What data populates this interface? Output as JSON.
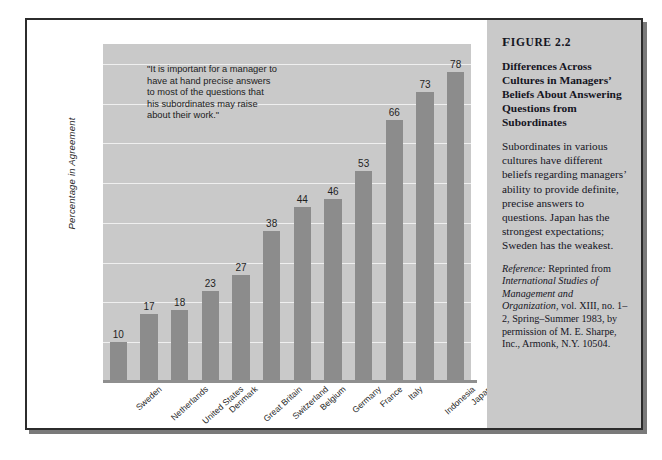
{
  "figure": {
    "number_prefix": "F",
    "number": "IGURE 2.2",
    "title": "Differences Across Cultures in Managers’ Beliefs About Answering Questions from Subordinates",
    "body": "Subordinates in various cultures have different beliefs regarding managers’ ability to provide definite, precise answers to questions. Japan has the strongest expectations; Sweden has the weakest.",
    "reference_label": "Reference:",
    "reference_text_1": " Reprinted from ",
    "reference_italic_1": "International Studies of Management and Organization",
    "reference_text_2": ", vol. XIII, no. 1–2, Spring–Summer 1983, by permission of M. E. Sharpe, Inc., Armonk, N.Y. 10504."
  },
  "quote": {
    "lines": [
      "\"It is important for a manager to",
      "have at hand precise answers",
      "to most of the questions that",
      "his subordinates may raise",
      "about their work.\""
    ]
  },
  "chart_data": {
    "type": "bar",
    "title": "",
    "xlabel": "",
    "ylabel": "Percentage in Agreement",
    "ylim": [
      0,
      85
    ],
    "yticks": [
      10,
      20,
      30,
      40,
      50,
      60,
      70,
      80
    ],
    "grid": true,
    "legend": "none",
    "categories": [
      "Sweden",
      "Netherlands",
      "United States",
      "Denmark",
      "Great Britain",
      "Switzerland",
      "Belgium",
      "Germany",
      "France",
      "Italy",
      "Indonesia",
      "Japan"
    ],
    "values": [
      10,
      17,
      18,
      23,
      27,
      38,
      44,
      46,
      53,
      66,
      73,
      78
    ]
  },
  "colors": {
    "bar": "#8c8c8c",
    "plot_background": "#c9c9c9",
    "panel_background": "#c9c9c9",
    "gridline": "#efefef",
    "frame": "#2c2c2c",
    "text": "#1f1f1f"
  }
}
